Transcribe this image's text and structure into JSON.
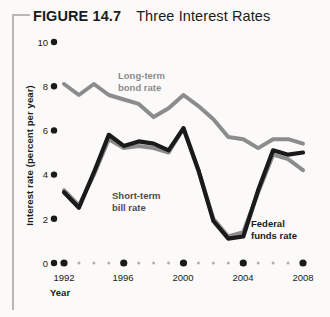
{
  "figure": {
    "label": "FIGURE 14.7",
    "title": "Three Interest Rates"
  },
  "colors": {
    "bond_rate": "#8c8c8c",
    "bill_rate": "#8c8c8c",
    "fed_funds": "#1a1a1a",
    "axis": "#1a1a1a",
    "frame": "#b9b7b3",
    "background": "#fbfaf8"
  },
  "axes": {
    "ylabel": "Interest rate (percent per year)",
    "xlabel": "Year",
    "yticks": [
      "0",
      "2",
      "4",
      "6",
      "8",
      "10"
    ],
    "xticks": [
      "1992",
      "1996",
      "2000",
      "2004",
      "2008"
    ],
    "ylim": [
      0,
      10
    ],
    "xlim": [
      1992,
      2008
    ]
  },
  "annotations": {
    "bond": "Long-term\nbond rate",
    "bill": "Short-term\nbill rate",
    "fed": "Federal\nfunds rate"
  },
  "chart_data": {
    "type": "line",
    "title": "Three Interest Rates",
    "xlabel": "Year",
    "ylabel": "Interest rate (percent per year)",
    "xlim": [
      1992,
      2008
    ],
    "ylim": [
      0,
      10
    ],
    "grid": false,
    "legend": "inline-annotations",
    "x": [
      1992,
      1993,
      1994,
      1995,
      1996,
      1997,
      1998,
      1999,
      2000,
      2001,
      2002,
      2003,
      2004,
      2005,
      2006,
      2007,
      2008
    ],
    "series": [
      {
        "name": "Long-term bond rate",
        "color": "#8c8c8c",
        "values": [
          8.1,
          7.6,
          8.1,
          7.6,
          7.4,
          7.2,
          6.6,
          7.0,
          7.6,
          7.1,
          6.5,
          5.7,
          5.6,
          5.2,
          5.6,
          5.6,
          5.4
        ]
      },
      {
        "name": "Short-term bill rate",
        "color": "#8c8c8c",
        "values": [
          3.3,
          2.6,
          4.0,
          5.6,
          5.2,
          5.3,
          5.2,
          5.0,
          6.1,
          4.2,
          2.0,
          1.2,
          1.4,
          3.2,
          4.9,
          4.7,
          4.2
        ]
      },
      {
        "name": "Federal funds rate",
        "color": "#1a1a1a",
        "values": [
          3.2,
          2.5,
          4.1,
          5.8,
          5.3,
          5.5,
          5.4,
          5.1,
          6.1,
          4.2,
          1.9,
          1.1,
          1.2,
          3.3,
          5.1,
          4.9,
          5.0
        ]
      }
    ]
  }
}
